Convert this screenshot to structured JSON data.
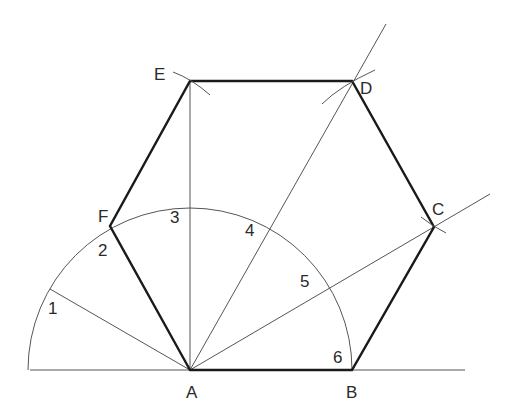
{
  "diagram": {
    "vertices": [
      {
        "name": "A",
        "x": 190,
        "y": 370,
        "label_x": 186,
        "label_y": 398
      },
      {
        "name": "B",
        "x": 352,
        "y": 370,
        "label_x": 346,
        "label_y": 398
      },
      {
        "name": "C",
        "x": 434,
        "y": 227,
        "label_x": 432,
        "label_y": 215
      },
      {
        "name": "D",
        "x": 352,
        "y": 81,
        "label_x": 360,
        "label_y": 94
      },
      {
        "name": "E",
        "x": 190,
        "y": 81,
        "label_x": 154,
        "label_y": 80
      },
      {
        "name": "F",
        "x": 110,
        "y": 226,
        "label_x": 98,
        "label_y": 222
      }
    ],
    "division_labels": [
      {
        "text": "1",
        "x": 48,
        "y": 314
      },
      {
        "text": "2",
        "x": 98,
        "y": 256
      },
      {
        "text": "3",
        "x": 170,
        "y": 223
      },
      {
        "text": "4",
        "x": 245,
        "y": 236
      },
      {
        "text": "5",
        "x": 300,
        "y": 287
      },
      {
        "text": "6",
        "x": 333,
        "y": 363
      }
    ],
    "arc": {
      "center": "A",
      "radius": 162
    },
    "baseline": {
      "x1": 30,
      "x2": 465,
      "y": 370
    }
  }
}
